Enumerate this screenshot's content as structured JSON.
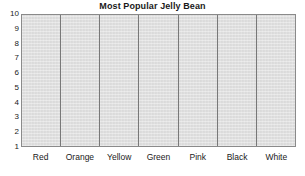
{
  "chart_data": {
    "type": "bar",
    "title": "Most Popular Jelly Bean",
    "xlabel": "",
    "ylabel": "",
    "categories": [
      "Red",
      "Orange",
      "Yellow",
      "Green",
      "Pink",
      "Black",
      "White"
    ],
    "values": [
      0,
      0,
      0,
      0,
      0,
      0,
      0
    ],
    "ylim": [
      1,
      10
    ],
    "yticks": [
      10,
      9,
      8,
      7,
      6,
      5,
      4,
      3,
      2,
      1
    ],
    "ytick_labels": [
      "10",
      "9",
      "8",
      "7",
      "6",
      "5",
      "4",
      "3",
      "2",
      "1"
    ],
    "grid": false,
    "vertical_separators": true,
    "legend": null,
    "note": "Blank tally/bar chart template: axis and category columns drawn, no bars plotted.",
    "colors": {
      "plot_background": "#e2e2e2",
      "frame": "#8a8a8a",
      "separator": "#787878",
      "text": "#1a1a1a",
      "page_background": "#ffffff"
    }
  }
}
